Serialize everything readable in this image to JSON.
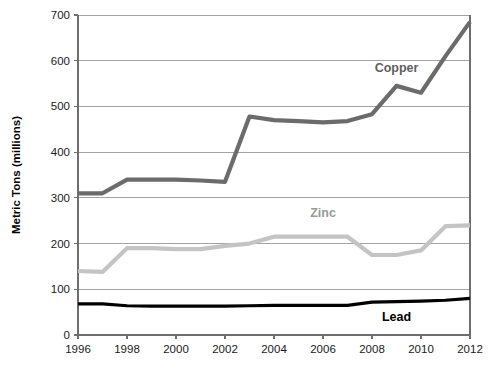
{
  "chart_data": {
    "type": "line",
    "title": "",
    "xlabel": "",
    "ylabel": "Metric Tons (millions)",
    "xlim": [
      1996,
      2012
    ],
    "ylim": [
      0,
      700
    ],
    "grid": true,
    "legend_position": "inline-labels",
    "x": [
      1996,
      1997,
      1998,
      1999,
      2000,
      2001,
      2002,
      2003,
      2004,
      2005,
      2006,
      2007,
      2008,
      2009,
      2010,
      2011,
      2012
    ],
    "xticks": [
      1996,
      1998,
      2000,
      2002,
      2004,
      2006,
      2008,
      2010,
      2012
    ],
    "xtick_labels": [
      "1996",
      "1998",
      "2000",
      "2002",
      "2004",
      "2006",
      "2008",
      "2010",
      "2012"
    ],
    "yticks": [
      0,
      100,
      200,
      300,
      400,
      500,
      600,
      700
    ],
    "ytick_labels": [
      "0",
      "100",
      "200",
      "300",
      "400",
      "500",
      "600",
      "700"
    ],
    "series": [
      {
        "name": "Copper",
        "color": "#6b6b6b",
        "width": 4.2,
        "label_x": 2009,
        "label_y": 575,
        "values": [
          310,
          310,
          340,
          340,
          340,
          338,
          335,
          478,
          470,
          468,
          465,
          468,
          483,
          545,
          530,
          610,
          685
        ]
      },
      {
        "name": "Zinc",
        "color": "#c4c4c4",
        "width": 4.2,
        "label_x": 2006,
        "label_y": 258,
        "values": [
          140,
          138,
          190,
          190,
          188,
          188,
          195,
          200,
          215,
          215,
          215,
          215,
          175,
          175,
          185,
          238,
          240
        ]
      },
      {
        "name": "Lead",
        "color": "#000000",
        "width": 3.2,
        "label_x": 2009,
        "label_y": 30,
        "values": [
          68,
          68,
          64,
          63,
          63,
          63,
          63,
          64,
          65,
          65,
          65,
          65,
          72,
          73,
          74,
          76,
          80
        ]
      }
    ]
  },
  "plot_geometry": {
    "left": 78,
    "right": 470,
    "top": 15,
    "bottom": 335
  }
}
